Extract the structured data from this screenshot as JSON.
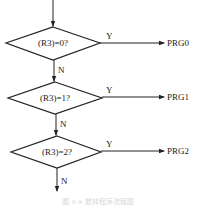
{
  "diagram": {
    "type": "flowchart",
    "decisions": [
      {
        "condition": "(R3)=0?",
        "yes_label": "Y",
        "no_label": "N",
        "target": "PRG0"
      },
      {
        "condition": "(R3)=1?",
        "yes_label": "Y",
        "no_label": "N",
        "target": "PRG1"
      },
      {
        "condition": "(R3)=2?",
        "yes_label": "Y",
        "no_label": "N",
        "target": "PRG2"
      }
    ],
    "caption": "图 x-x 散转程序流程图"
  },
  "colors": {
    "line": "#222222",
    "background": "#ffffff"
  }
}
